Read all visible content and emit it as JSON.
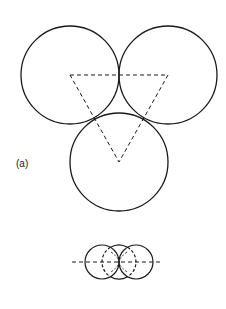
{
  "figure": {
    "label": "(a)",
    "top_view": {
      "circles": [
        {
          "name": "left",
          "cx": 70,
          "cy": 75,
          "r": 49
        },
        {
          "name": "right",
          "cx": 168,
          "cy": 75,
          "r": 49
        },
        {
          "name": "bottom",
          "cx": 119,
          "cy": 162,
          "r": 49
        }
      ],
      "triangle": [
        [
          70,
          75
        ],
        [
          168,
          75
        ],
        [
          119,
          162
        ]
      ]
    },
    "side_view": {
      "circles": [
        {
          "name": "left",
          "cx": 102,
          "cy": 262,
          "r": 17
        },
        {
          "name": "middle",
          "cx": 119,
          "cy": 262,
          "r": 17
        },
        {
          "name": "right",
          "cx": 136,
          "cy": 262,
          "r": 17
        }
      ],
      "axis": {
        "x1": 72,
        "x2": 163,
        "y": 262
      }
    },
    "stroke_color": "#1a1a1a"
  }
}
